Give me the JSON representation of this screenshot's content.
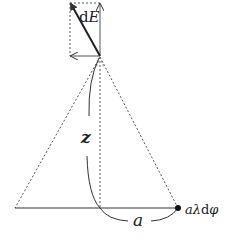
{
  "diagram": {
    "labels": {
      "field_element_d": "d",
      "field_element_E": "E",
      "axis_distance": "z",
      "radius": "a",
      "charge_element_a": "a",
      "charge_element_lambda": "λ",
      "charge_element_d": "d",
      "charge_element_phi": "φ"
    },
    "elements": [
      {
        "name": "dE vector",
        "type": "arrow",
        "from": [
          100,
          56
        ],
        "to": [
          70,
          3
        ]
      },
      {
        "name": "vertical component",
        "type": "arrow",
        "from": [
          100,
          56
        ],
        "to": [
          100,
          3
        ]
      },
      {
        "name": "horizontal component",
        "type": "arrow",
        "from": [
          100,
          56
        ],
        "to": [
          70,
          56
        ]
      },
      {
        "name": "cone left edge",
        "type": "dashed-line"
      },
      {
        "name": "cone right edge",
        "type": "dashed-line"
      },
      {
        "name": "symmetry axis",
        "type": "dotted-line"
      },
      {
        "name": "base diameter",
        "type": "line"
      },
      {
        "name": "charge element",
        "type": "point"
      }
    ],
    "colors": {
      "stroke": "#333333",
      "dashed": "#555555",
      "background": "#ffffff"
    }
  }
}
